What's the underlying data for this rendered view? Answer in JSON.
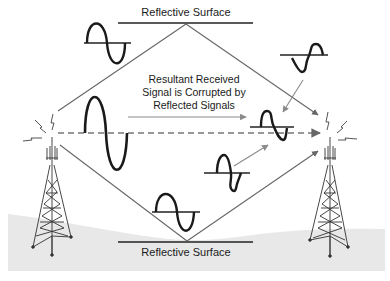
{
  "diagram": {
    "title_top_surface": "Reflective Surface",
    "title_bottom_surface": "Reflective Surface",
    "caption_lines": [
      "Resultant Received",
      "Signal is Corrupted by",
      "Reflected Signals"
    ],
    "elements": {
      "transmitter": "Transmitting tower (left)",
      "receiver": "Receiving tower (right)",
      "direct_path": "Dashed direct line-of-sight path",
      "reflected_paths": [
        "Upper path via top reflective surface",
        "Lower path via bottom reflective surface"
      ],
      "waveforms": [
        "Direct sine wave",
        "Upper reflected sine wave",
        "Lower reflected sine wave",
        "Distorted upper wave",
        "Distorted lower wave",
        "Corrupted resultant wave"
      ]
    },
    "colors": {
      "line": "#555555",
      "wave": "#1a1a1a",
      "arrow": "#8c8c8c",
      "ground": "#e6e6e6",
      "text": "#1a1a1a"
    }
  }
}
